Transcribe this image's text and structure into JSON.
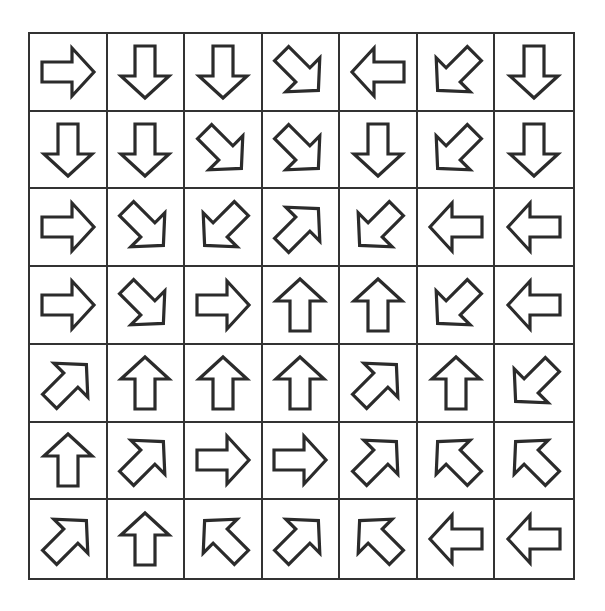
{
  "puzzle": {
    "rows": 7,
    "cols": 7,
    "colors": {
      "grid_line": "#333333",
      "arrow_outline": "#2b2b2b",
      "background": "#ffffff"
    },
    "grid": [
      [
        "right",
        "down",
        "down",
        "down-right",
        "left",
        "down-left",
        "down"
      ],
      [
        "down",
        "down",
        "down-right",
        "down-right",
        "down",
        "down-left",
        "down"
      ],
      [
        "right",
        "down-right",
        "down-left",
        "up-right",
        "down-left",
        "left",
        "left"
      ],
      [
        "right",
        "down-right",
        "right",
        "up",
        "up",
        "down-left",
        "left"
      ],
      [
        "up-right",
        "up",
        "up",
        "up",
        "up-right",
        "up",
        "down-left"
      ],
      [
        "up",
        "up-right",
        "right",
        "right",
        "up-right",
        "up-left",
        "up-left"
      ],
      [
        "up-right",
        "up",
        "up-left",
        "up-right",
        "up-left",
        "left",
        "left"
      ]
    ]
  }
}
